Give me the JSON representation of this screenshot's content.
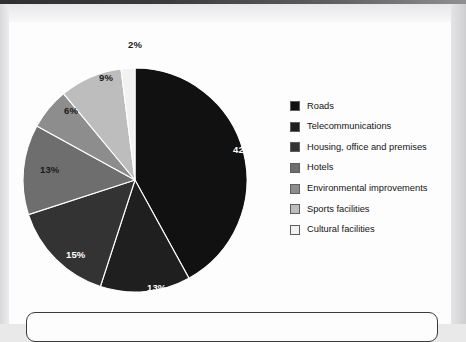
{
  "chart_data": {
    "type": "pie",
    "title": "",
    "categories": [
      "Roads",
      "Telecommunications",
      "Housing, office and premises",
      "Hotels",
      "Environmental improvements",
      "Sports facilities",
      "Cultural facilities"
    ],
    "values": [
      42,
      13,
      15,
      13,
      6,
      9,
      2
    ],
    "value_labels": [
      "42%",
      "13%",
      "15%",
      "13%",
      "6%",
      "9%",
      "2%"
    ],
    "colors": [
      "#111111",
      "#1f1f1f",
      "#333333",
      "#6e6e6e",
      "#8d8d8d",
      "#bdbdbd",
      "#f2f2f2"
    ],
    "label_text_colors": [
      "#ffffff",
      "#ffffff",
      "#ffffff",
      "#1b1b1b",
      "#1b1b1b",
      "#1b1b1b",
      "#1b1b1b"
    ],
    "start_angle_deg": 0,
    "direction": "clockwise",
    "legend_position": "right",
    "grid": false
  },
  "legend": {
    "items": [
      {
        "label": "Roads",
        "color": "#111111"
      },
      {
        "label": "Telecommunications",
        "color": "#1f1f1f"
      },
      {
        "label": "Housing, office and premises",
        "color": "#333333"
      },
      {
        "label": "Hotels",
        "color": "#6e6e6e"
      },
      {
        "label": "Environmental improvements",
        "color": "#8d8d8d"
      },
      {
        "label": "Sports facilities",
        "color": "#bdbdbd"
      },
      {
        "label": "Cultural facilities",
        "color": "#f2f2f2"
      }
    ]
  },
  "slice_labels": [
    {
      "text": "42%",
      "x": 224,
      "y": 122,
      "tone": "on-dark"
    },
    {
      "text": "13%",
      "x": 138,
      "y": 260,
      "tone": "on-dark"
    },
    {
      "text": "15%",
      "x": 57,
      "y": 227,
      "tone": "on-dark"
    },
    {
      "text": "13%",
      "x": 31,
      "y": 142,
      "tone": "on-light"
    },
    {
      "text": "6%",
      "x": 55,
      "y": 83,
      "tone": "on-light"
    },
    {
      "text": "9%",
      "x": 90,
      "y": 50,
      "tone": "on-light"
    },
    {
      "text": "2%",
      "x": 119,
      "y": 17,
      "tone": "on-light"
    }
  ],
  "note_box": {
    "text": ""
  }
}
